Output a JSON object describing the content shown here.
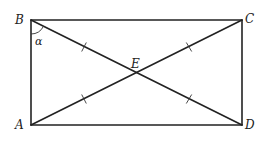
{
  "diagram": {
    "type": "geometry-rectangle-diagonals",
    "points": {
      "A": {
        "label": "A",
        "x": 31,
        "y": 125
      },
      "B": {
        "label": "B",
        "x": 31,
        "y": 20
      },
      "C": {
        "label": "C",
        "x": 242,
        "y": 20
      },
      "D": {
        "label": "D",
        "x": 242,
        "y": 125
      },
      "E": {
        "label": "E",
        "x": 136.5,
        "y": 72.5
      }
    },
    "angle_label": "α",
    "segments": [
      "AB",
      "BC",
      "CD",
      "DA",
      "BD",
      "AC"
    ],
    "equal_marks": [
      "BE",
      "EC",
      "AE",
      "ED"
    ]
  }
}
